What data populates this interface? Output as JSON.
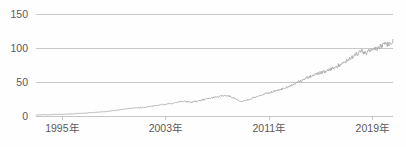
{
  "chart_data": {
    "type": "line",
    "title": "",
    "subtitle": "",
    "xlabel": "",
    "ylabel": "",
    "grid": true,
    "legend": false,
    "legend_position": "none",
    "line_color": "#a6a6a6",
    "text_color": "#595959",
    "grid_color": "#b9b9b9",
    "background_color": "#fefefe",
    "ylim": [
      0,
      150
    ],
    "yticks": [
      0,
      50,
      100,
      150
    ],
    "ytick_labels": [
      "0",
      "50",
      "100",
      "150"
    ],
    "xlim": [
      1993,
      2020.6
    ],
    "xticks": [
      1995,
      2003,
      2011,
      2019
    ],
    "xtick_labels": [
      "1995年",
      "2003年",
      "2011年",
      "2019年"
    ],
    "series": [
      {
        "name": "index",
        "x": [
          1993.0,
          1993.3,
          1993.6,
          1993.9,
          1994.2,
          1994.5,
          1994.8,
          1995.1,
          1995.4,
          1995.7,
          1996.0,
          1996.3,
          1996.6,
          1996.9,
          1997.2,
          1997.5,
          1997.8,
          1998.1,
          1998.4,
          1998.7,
          1999.0,
          1999.3,
          1999.6,
          1999.9,
          2000.2,
          2000.5,
          2000.8,
          2001.1,
          2001.4,
          2001.7,
          2002.0,
          2002.3,
          2002.6,
          2002.9,
          2003.2,
          2003.5,
          2003.8,
          2004.1,
          2004.4,
          2004.7,
          2005.0,
          2005.3,
          2005.6,
          2005.9,
          2006.2,
          2006.5,
          2006.8,
          2007.1,
          2007.4,
          2007.7,
          2008.0,
          2008.3,
          2008.6,
          2008.9,
          2009.2,
          2009.5,
          2009.8,
          2010.1,
          2010.4,
          2010.7,
          2011.0,
          2011.3,
          2011.6,
          2011.9,
          2012.2,
          2012.5,
          2012.8,
          2013.1,
          2013.4,
          2013.7,
          2014.0,
          2014.3,
          2014.6,
          2014.9,
          2015.2,
          2015.5,
          2015.8,
          2016.1,
          2016.4,
          2016.7,
          2017.0,
          2017.3,
          2017.6,
          2017.9,
          2018.2,
          2018.5,
          2018.8,
          2019.1,
          2019.4,
          2019.7,
          2020.0,
          2020.3,
          2020.6
        ],
        "values": [
          1.5,
          1.6,
          1.8,
          1.9,
          2.0,
          2.2,
          2.4,
          2.5,
          2.7,
          3.0,
          3.3,
          3.6,
          3.9,
          4.3,
          4.8,
          5.2,
          5.6,
          6.1,
          6.6,
          7.2,
          7.9,
          8.6,
          9.4,
          10.2,
          11.0,
          11.6,
          12.0,
          12.3,
          12.9,
          13.6,
          14.5,
          15.4,
          16.2,
          16.9,
          17.5,
          18.4,
          19.6,
          20.8,
          21.5,
          21.0,
          20.4,
          21.2,
          22.5,
          23.8,
          25.0,
          26.2,
          27.4,
          28.6,
          29.6,
          30.2,
          29.0,
          26.5,
          23.5,
          21.8,
          22.6,
          24.4,
          26.6,
          28.8,
          30.6,
          32.4,
          34.2,
          35.6,
          37.2,
          39.0,
          41.0,
          43.2,
          45.6,
          48.2,
          51.0,
          53.8,
          56.6,
          59.2,
          61.4,
          63.0,
          64.2,
          66.0,
          68.5,
          71.5,
          74.8,
          78.2,
          81.6,
          85.0,
          88.6,
          92.4,
          95.0,
          92.0,
          96.5,
          100.2,
          98.0,
          103.5,
          107.0,
          104.0,
          110.5
        ]
      }
    ],
    "annotations": []
  }
}
